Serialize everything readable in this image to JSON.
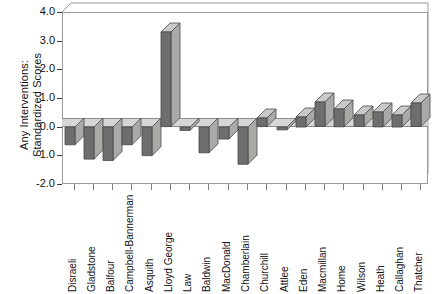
{
  "chart_data": {
    "type": "bar",
    "title": "",
    "subtitle": "",
    "xlabel": "",
    "ylabel": "Any Interventions:\nStandardized Scores",
    "ylim": [
      -2.0,
      4.0
    ],
    "yticks": [
      "-2.0",
      "-1.0",
      "0.0",
      "1.0",
      "2.0",
      "3.0",
      "4.0"
    ],
    "ytick_values": [
      -2.0,
      -1.0,
      0.0,
      1.0,
      2.0,
      3.0,
      4.0
    ],
    "grid": false,
    "legend": "none",
    "style": "3d-bar",
    "categories": [
      "Disraeli",
      "Gladstone",
      "Balfour",
      "Campbell-Bannerman",
      "Asquith",
      "Lloyd George",
      "Law",
      "Baldwin",
      "MacDonald",
      "Chamberlain",
      "Churchill",
      "Attlee",
      "Eden",
      "Macmillan",
      "Home",
      "Wilson",
      "Heath",
      "Callaghan",
      "Thatcher"
    ],
    "values": [
      -0.62,
      -1.12,
      -1.17,
      -0.62,
      -1.0,
      3.3,
      -0.12,
      -0.9,
      -0.42,
      -1.3,
      0.3,
      -0.1,
      0.35,
      0.85,
      0.62,
      0.4,
      0.52,
      0.42,
      0.82
    ]
  },
  "colors": {
    "bar_front": "#6e6e6e",
    "bar_top": "#c9c9c7",
    "bar_side": "#a9a9a7",
    "bar_outline": "#4a4a4a",
    "floor": "#d6d6d4",
    "frame": "#9b9b9b",
    "text": "#111111",
    "background": "#ffffff"
  }
}
